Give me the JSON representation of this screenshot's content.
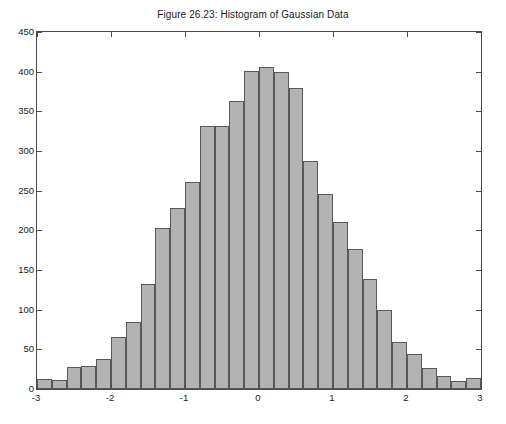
{
  "chart_data": {
    "type": "bar",
    "title": "Figure 26.23: Histogram of Gaussian Data",
    "xlabel": "",
    "ylabel": "",
    "xlim": [
      -3,
      3
    ],
    "ylim": [
      0,
      450
    ],
    "grid": false,
    "legend": null,
    "bar_color": "#b3b3b3",
    "bar_edge_color": "#595959",
    "axis_color": "#4a4a4a",
    "text_color": "#1a1a1a",
    "bin_width": 0.25,
    "bin_count": 24,
    "x_tick_labels": [
      "-3",
      "-2",
      "-1",
      "0",
      "1",
      "2",
      "3"
    ],
    "x_tick_values": [
      -3,
      -2,
      -1,
      0,
      1,
      2,
      3
    ],
    "y_tick_labels": [
      "0",
      "50",
      "100",
      "150",
      "200",
      "250",
      "300",
      "350",
      "400",
      "450"
    ],
    "y_tick_values": [
      0,
      50,
      100,
      150,
      200,
      250,
      300,
      350,
      400,
      450
    ],
    "bin_centers": [
      -2.875,
      -2.625,
      -2.375,
      -2.125,
      -1.875,
      -1.625,
      -1.375,
      -1.125,
      -0.875,
      -0.625,
      -0.375,
      -0.125,
      0.125,
      0.375,
      0.625,
      0.875,
      1.125,
      1.375,
      1.625,
      1.875,
      2.125,
      2.375,
      2.625,
      2.875
    ],
    "bin_edges": [
      -3,
      -2.75,
      -2.5,
      -2.25,
      -2,
      -1.75,
      -1.5,
      -1.25,
      -1,
      -0.75,
      -0.5,
      -0.25,
      0,
      0.25,
      0.5,
      0.75,
      1,
      1.25,
      1.5,
      1.75,
      2,
      2.25,
      2.5,
      2.75,
      3
    ],
    "categories": [
      "-2.875",
      "-2.625",
      "-2.375",
      "-2.125",
      "-1.875",
      "-1.625",
      "-1.375",
      "-1.125",
      "-0.875",
      "-0.625",
      "-0.375",
      "-0.125",
      "0.125",
      "0.375",
      "0.625",
      "0.875",
      "1.125",
      "1.375",
      "1.625",
      "1.875",
      "2.125",
      "2.375",
      "2.625",
      "2.875"
    ],
    "values": [
      12,
      11,
      28,
      29,
      38,
      65,
      85,
      133,
      203,
      228,
      261,
      332,
      332,
      363,
      401,
      406,
      399,
      379,
      287,
      246,
      211,
      177,
      139,
      100
    ]
  },
  "extra_bins_note": "",
  "tail_values": [
    59,
    44,
    27,
    16,
    10,
    14
  ]
}
